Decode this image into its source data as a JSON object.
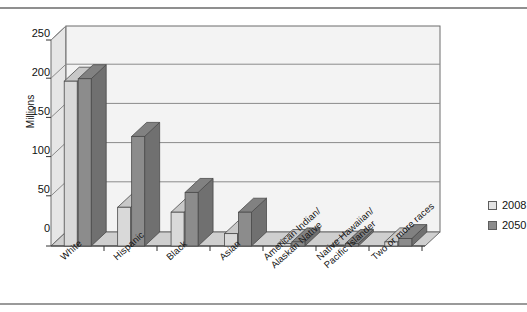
{
  "chart_data": {
    "type": "bar",
    "title": "",
    "subtitle": "",
    "xlabel": "",
    "ylabel": "Millions",
    "ylim": [
      0,
      250
    ],
    "yticks": [
      0,
      50,
      100,
      150,
      200,
      250
    ],
    "ytick_labels": [
      "0",
      "50",
      "100",
      "150",
      "200",
      "250"
    ],
    "grid": true,
    "legend_position": "right",
    "three_d": true,
    "categories": [
      "White",
      "Hispanic",
      "Black",
      "Asian",
      "American Indian/\nAlaskan Native",
      "Native Hawaiian/\nPacific Islander",
      "Two or more races"
    ],
    "series": [
      {
        "name": "2008",
        "color": "#d9d9d9",
        "values": [
          200,
          47,
          41,
          15,
          3,
          1,
          5
        ]
      },
      {
        "name": "2050",
        "color": "#8c8c8c",
        "values": [
          203,
          133,
          65,
          41,
          5,
          3,
          9
        ]
      }
    ]
  },
  "legend": {
    "items": [
      {
        "label": "2008",
        "swatch": "light-gray"
      },
      {
        "label": "2050",
        "swatch": "dark-gray"
      }
    ]
  },
  "axis": {
    "y_title": "Millions",
    "y_tick_labels": [
      "250",
      "200",
      "150",
      "100",
      "50",
      "0"
    ]
  },
  "categories_display": [
    {
      "line1": "White",
      "line2": ""
    },
    {
      "line1": "Hispanic",
      "line2": ""
    },
    {
      "line1": "Black",
      "line2": ""
    },
    {
      "line1": "Asian",
      "line2": ""
    },
    {
      "line1": "American Indian/",
      "line2": "Alaskan Native"
    },
    {
      "line1": "Native Hawaiian/",
      "line2": "Pacific Islander"
    },
    {
      "line1": "Two or more races",
      "line2": ""
    }
  ]
}
